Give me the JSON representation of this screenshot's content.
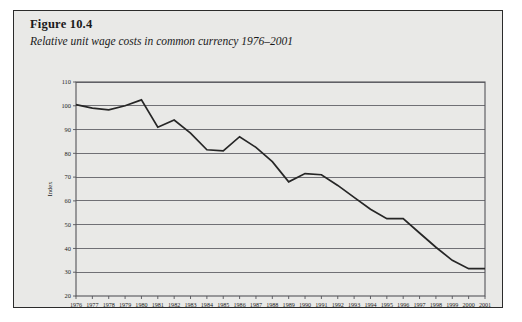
{
  "figure": {
    "number_label": "Figure 10.4",
    "subtitle": "Relative unit wage costs in common currency 1976–2001"
  },
  "chart_data": {
    "type": "line",
    "title": "Relative unit wage costs in common currency 1976–2001",
    "xlabel": "",
    "ylabel": "Index",
    "ylim": [
      20,
      110
    ],
    "yticks": [
      20,
      30,
      40,
      50,
      60,
      70,
      80,
      90,
      100,
      110
    ],
    "grid": true,
    "legend": "none",
    "categories": [
      "1976",
      "1977",
      "1978",
      "1979",
      "1980",
      "1981",
      "1982",
      "1983",
      "1984",
      "1985",
      "1986",
      "1987",
      "1988",
      "1989",
      "1990",
      "1991",
      "1992",
      "1993",
      "1994",
      "1995",
      "1996",
      "1997",
      "1998",
      "1999",
      "2000",
      "2001"
    ],
    "series": [
      {
        "name": "Relative unit wage costs (index)",
        "values": [
          100.5,
          99.0,
          98.3,
          100.0,
          102.5,
          91.0,
          94.0,
          88.5,
          81.5,
          81.0,
          87.0,
          82.5,
          76.5,
          68.0,
          71.5,
          71.0,
          66.5,
          61.5,
          56.5,
          52.5,
          52.5,
          46.5,
          40.5,
          35.0,
          31.5,
          31.5
        ]
      }
    ]
  }
}
